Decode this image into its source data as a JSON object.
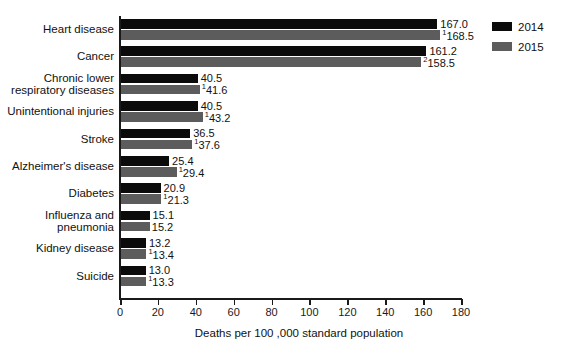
{
  "chart_data": {
    "type": "bar",
    "orientation": "horizontal",
    "title": "",
    "subtitle": "",
    "xlabel": "Deaths per 100 ,000 standard population",
    "ylabel": "",
    "xlim": [
      0,
      180
    ],
    "xticks": [
      0,
      20,
      40,
      60,
      80,
      100,
      120,
      140,
      160,
      180
    ],
    "xtick_labels": [
      "0",
      "20",
      "40",
      "60",
      "80",
      "100",
      "120",
      "140",
      "160",
      "180"
    ],
    "grid": false,
    "legend_position": "top-right",
    "categories": [
      "Heart disease",
      "Cancer",
      "Chronic lower respiratory diseases",
      "Unintentional injuries",
      "Stroke",
      "Alzheimer's disease",
      "Diabetes",
      "Influenza and pneumonia",
      "Kidney disease",
      "Suicide"
    ],
    "category_lines": [
      [
        "Heart disease"
      ],
      [
        "Cancer"
      ],
      [
        "Chronic lower",
        "respiratory diseases"
      ],
      [
        "Unintentional injuries"
      ],
      [
        "Stroke"
      ],
      [
        "Alzheimer's disease"
      ],
      [
        "Diabetes"
      ],
      [
        "Influenza and",
        "pneumonia"
      ],
      [
        "Kidney disease"
      ],
      [
        "Suicide"
      ]
    ],
    "series": [
      {
        "name": "2014",
        "color": "#0b0b0b",
        "values": [
          167.0,
          161.2,
          40.5,
          40.5,
          36.5,
          25.4,
          20.9,
          15.1,
          13.2,
          13.0
        ],
        "labels": [
          "167.0",
          "161.2",
          "40.5",
          "40.5",
          "36.5",
          "25.4",
          "20.9",
          "15.1",
          "13.2",
          "13.0"
        ],
        "superscripts": [
          "",
          "",
          "",
          "",
          "",
          "",
          "",
          "",
          "",
          ""
        ]
      },
      {
        "name": "2015",
        "color": "#5c5c5c",
        "values": [
          168.5,
          158.5,
          41.6,
          43.2,
          37.6,
          29.4,
          21.3,
          15.2,
          13.4,
          13.3
        ],
        "labels": [
          "168.5",
          "158.5",
          "41.6",
          "43.2",
          "37.6",
          "29.4",
          "21.3",
          "15.2",
          "13.4",
          "13.3"
        ],
        "superscripts": [
          "1",
          "2",
          "1",
          "1",
          "1",
          "1",
          "1",
          "",
          "1",
          "1"
        ]
      }
    ]
  },
  "legend": {
    "items": [
      {
        "label": "2014",
        "color": "#0b0b0b"
      },
      {
        "label": "2015",
        "color": "#5c5c5c"
      }
    ]
  },
  "axis": {
    "x_title": "Deaths per 100 ,000 standard population"
  }
}
